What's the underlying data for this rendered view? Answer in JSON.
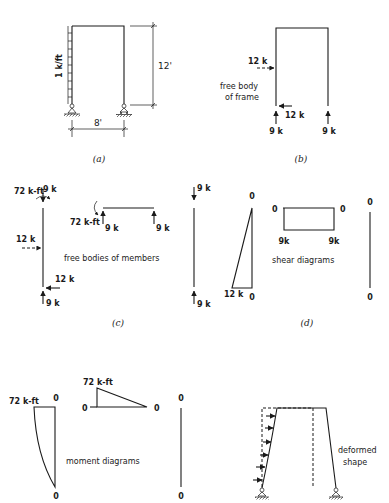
{
  "figure": {
    "panels": {
      "a": {
        "caption": "(a)",
        "load_label": "1 k/ft",
        "height_label": "12'",
        "width_label": "8'"
      },
      "b": {
        "caption": "(b)",
        "title_line1": "free body",
        "title_line2": "of frame",
        "top_force": "12 k",
        "bottom_force": "12 k",
        "left_reaction": "9 k",
        "right_reaction": "9 k"
      },
      "c": {
        "caption": "(c)",
        "title": "free bodies of members",
        "left_col_moment": "72 k-ft",
        "left_col_top_force": "9 k",
        "left_col_side_force": "12 k",
        "left_col_bottom_shear": "12 k",
        "left_col_bottom_reaction": "9 k",
        "beam_moment": "72 k-ft",
        "beam_left_force": "9 k",
        "beam_right_force": "9 k",
        "right_col_top_force": "9 k",
        "right_col_bottom_force": "9 k"
      },
      "d": {
        "caption": "(d)",
        "title": "shear diagrams",
        "left_col_top": "0",
        "left_col_bottom_value": "12 k",
        "left_col_bottom": "0",
        "beam_left_zero": "0",
        "beam_right_zero": "0",
        "beam_left_value": "9k",
        "beam_right_value": "9k",
        "right_col_top": "0",
        "right_col_bottom": "0"
      },
      "e": {
        "title": "moment diagrams",
        "left_col_value": "72 k-ft",
        "left_col_top": "0",
        "left_col_bottom": "0",
        "beam_value": "72 k-ft",
        "beam_left_zero": "0",
        "beam_right_zero": "0",
        "right_col_top": "0",
        "right_col_bottom": "0"
      },
      "f": {
        "title_line1": "deformed",
        "title_line2": "shape"
      }
    }
  }
}
